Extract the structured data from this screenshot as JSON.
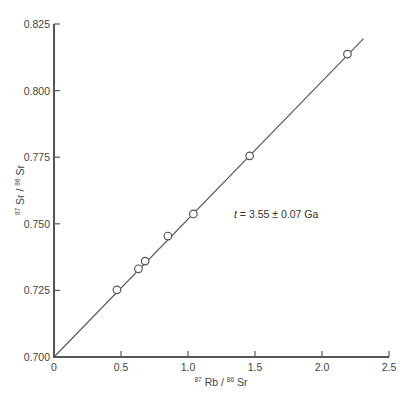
{
  "chart_data": {
    "type": "scatter",
    "title": "",
    "xlabel": "87Rb / 86Sr",
    "ylabel": "87Sr / 86Sr",
    "xlabel_parts": {
      "sup1": "87",
      "t1": "Rb",
      "sep": "/",
      "sup2": "86",
      "t2": "Sr"
    },
    "ylabel_parts": {
      "sup1": "87",
      "t1": "Sr",
      "sep": "/",
      "sup2": "86",
      "t2": "Sr"
    },
    "xlim": [
      0,
      2.5
    ],
    "ylim": [
      0.7,
      0.825
    ],
    "x_ticks": [
      "0",
      "0.5",
      "1.0",
      "1.5",
      "2.0",
      "2.5"
    ],
    "y_ticks": [
      "0.700",
      "0.725",
      "0.750",
      "0.775",
      "0.800",
      "0.825"
    ],
    "grid": false,
    "series": [
      {
        "name": "samples",
        "marker": "open-circle",
        "x": [
          0.47,
          0.63,
          0.68,
          0.85,
          1.04,
          1.46,
          2.19
        ],
        "y": [
          0.7252,
          0.7331,
          0.736,
          0.7454,
          0.7537,
          0.7755,
          0.8137
        ]
      }
    ],
    "fit_line": {
      "name": "isochron",
      "x": [
        0,
        2.31
      ],
      "y": [
        0.7,
        0.8195
      ]
    },
    "annotations": [
      {
        "text_var": "t",
        "text_rest": " = 3.55 ± 0.07 Ga",
        "x": 1.35,
        "y": 0.7545
      }
    ]
  }
}
